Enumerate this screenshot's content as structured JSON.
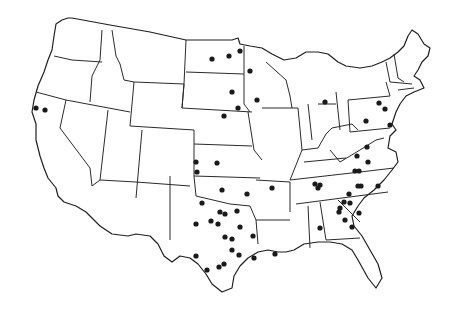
{
  "map": {
    "subject": "Contiguous United States with state boundaries",
    "marker_color": "#1a1a1a",
    "line_color": "#2a2a2a",
    "background": "#ffffff",
    "markers": [
      {
        "x": 36,
        "y": 108
      },
      {
        "x": 45,
        "y": 110
      },
      {
        "x": 212,
        "y": 59
      },
      {
        "x": 229,
        "y": 56
      },
      {
        "x": 240,
        "y": 51
      },
      {
        "x": 250,
        "y": 71
      },
      {
        "x": 232,
        "y": 92
      },
      {
        "x": 257,
        "y": 100
      },
      {
        "x": 238,
        "y": 108
      },
      {
        "x": 224,
        "y": 116
      },
      {
        "x": 325,
        "y": 102
      },
      {
        "x": 379,
        "y": 103
      },
      {
        "x": 385,
        "y": 109
      },
      {
        "x": 366,
        "y": 121
      },
      {
        "x": 390,
        "y": 125
      },
      {
        "x": 196,
        "y": 162
      },
      {
        "x": 217,
        "y": 163
      },
      {
        "x": 197,
        "y": 172
      },
      {
        "x": 222,
        "y": 190
      },
      {
        "x": 247,
        "y": 194
      },
      {
        "x": 272,
        "y": 188
      },
      {
        "x": 202,
        "y": 203
      },
      {
        "x": 220,
        "y": 212
      },
      {
        "x": 225,
        "y": 214
      },
      {
        "x": 237,
        "y": 211
      },
      {
        "x": 196,
        "y": 224
      },
      {
        "x": 211,
        "y": 221
      },
      {
        "x": 218,
        "y": 224
      },
      {
        "x": 240,
        "y": 227
      },
      {
        "x": 225,
        "y": 237
      },
      {
        "x": 232,
        "y": 239
      },
      {
        "x": 253,
        "y": 236
      },
      {
        "x": 232,
        "y": 250
      },
      {
        "x": 239,
        "y": 255
      },
      {
        "x": 196,
        "y": 256
      },
      {
        "x": 254,
        "y": 258
      },
      {
        "x": 207,
        "y": 270
      },
      {
        "x": 219,
        "y": 267
      },
      {
        "x": 224,
        "y": 264
      },
      {
        "x": 275,
        "y": 254
      },
      {
        "x": 315,
        "y": 184
      },
      {
        "x": 320,
        "y": 185
      },
      {
        "x": 318,
        "y": 188
      },
      {
        "x": 320,
        "y": 228
      },
      {
        "x": 367,
        "y": 147
      },
      {
        "x": 357,
        "y": 156
      },
      {
        "x": 368,
        "y": 162
      },
      {
        "x": 355,
        "y": 171
      },
      {
        "x": 359,
        "y": 171
      },
      {
        "x": 358,
        "y": 186
      },
      {
        "x": 378,
        "y": 186
      },
      {
        "x": 349,
        "y": 194
      },
      {
        "x": 344,
        "y": 202
      },
      {
        "x": 340,
        "y": 208
      },
      {
        "x": 339,
        "y": 212
      },
      {
        "x": 350,
        "y": 203
      },
      {
        "x": 359,
        "y": 213
      },
      {
        "x": 345,
        "y": 220
      },
      {
        "x": 352,
        "y": 227
      },
      {
        "x": 361,
        "y": 186
      }
    ]
  }
}
